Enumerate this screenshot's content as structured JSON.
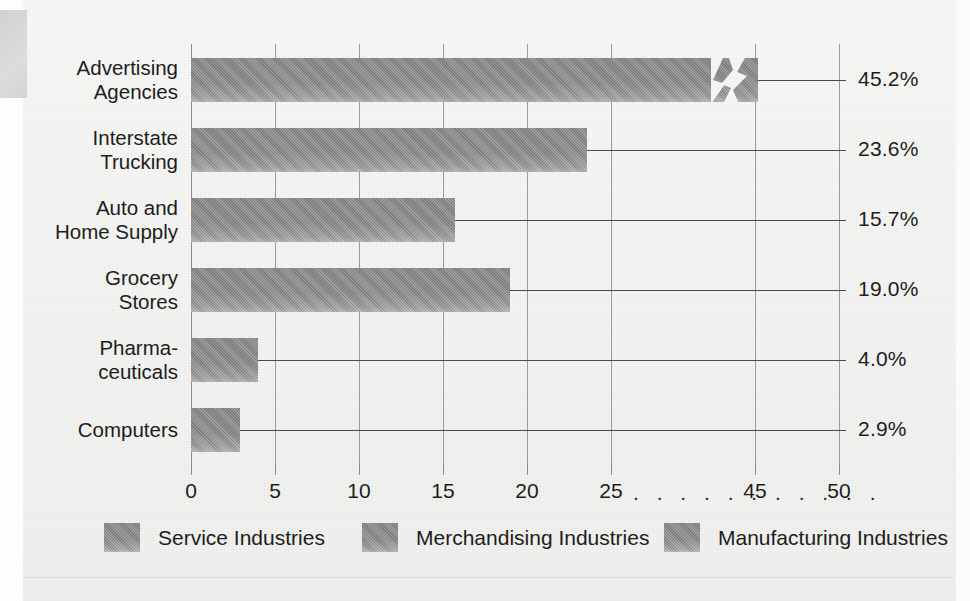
{
  "chart_data": {
    "type": "bar",
    "orientation": "horizontal",
    "title": "",
    "xlabel": "",
    "ylabel": "",
    "grid": true,
    "xlim": [
      0,
      50
    ],
    "axis_break": {
      "present": true,
      "between": [
        25,
        45
      ],
      "ellipsis": ". . . . . . . . . . ."
    },
    "categories": [
      "Advertising Agencies",
      "Interstate Trucking",
      "Auto and Home Supply",
      "Grocery Stores",
      "Pharmaceuticals",
      "Computers"
    ],
    "category_label_lines": [
      [
        "Advertising",
        "Agencies"
      ],
      [
        "Interstate",
        "Trucking"
      ],
      [
        "Auto and",
        "Home Supply"
      ],
      [
        "Grocery",
        "Stores"
      ],
      [
        "Pharma-",
        "ceuticals"
      ],
      [
        "Computers"
      ]
    ],
    "values": [
      45.2,
      23.6,
      15.7,
      19.0,
      4.0,
      2.9
    ],
    "value_labels": [
      "45.2%",
      "23.6%",
      "15.7%",
      "19.0%",
      "4.0%",
      "2.9%"
    ],
    "segment_of": [
      "Service Industries",
      "Service Industries",
      "Merchandising Industries",
      "Merchandising Industries",
      "Manufacturing Industries",
      "Manufacturing Industries"
    ],
    "xticks": [
      0,
      5,
      10,
      15,
      20,
      25,
      45,
      50
    ],
    "xtick_labels": [
      "0",
      "5",
      "10",
      "15",
      "20",
      "25",
      "45",
      "50"
    ],
    "legend": {
      "position": "bottom",
      "entries": [
        {
          "label": "Service Industries",
          "color": "#8c8c8c"
        },
        {
          "label": "Merchandising Industries",
          "color": "#8c8c8c"
        },
        {
          "label": "Manufacturing Industries",
          "color": "#8c8c8c"
        }
      ]
    },
    "colors": {
      "bar": "#8c8c8c",
      "grid": "#9a9a98",
      "text": "#1d1d1b",
      "leader": "#4a4a48",
      "background": "#f4f4f2"
    }
  }
}
